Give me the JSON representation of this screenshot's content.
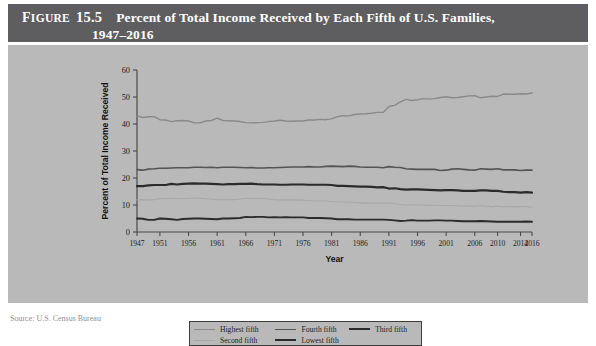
{
  "figure": {
    "label_word": "Figure",
    "label_word_initial": "F",
    "label_word_rest": "IGURE",
    "number": "15.5",
    "title_line1": "Percent of Total Income Received by Each Fifth of U.S. Families,",
    "title_line2": "1947–2016",
    "header_bg": "#5e5e60",
    "panel_bg": "#b9b9b9"
  },
  "legend": {
    "items": [
      {
        "label": "Highest fifth",
        "color": "#8a8a8a",
        "width": 1.4
      },
      {
        "label": "Fourth fifth",
        "color": "#545454",
        "width": 1.6
      },
      {
        "label": "Third fifth",
        "color": "#2b2b2b",
        "width": 2.2
      },
      {
        "label": "Second fifth",
        "color": "#a8a8a8",
        "width": 1.1
      },
      {
        "label": "Lowest fifth",
        "color": "#2b2b2b",
        "width": 1.9
      }
    ]
  },
  "source": {
    "text": "Source: U.S. Census Bureau"
  },
  "chart_data": {
    "type": "line",
    "title": "Percent of Total Income Received by Each Fifth of U.S. Families, 1947–2016",
    "xlabel": "Year",
    "ylabel": "Percent of Total Income Received",
    "xlim": [
      1947,
      2016
    ],
    "ylim": [
      0,
      60
    ],
    "ytick_values": [
      0,
      10,
      20,
      30,
      40,
      50,
      60
    ],
    "ytick_labels": [
      "0",
      "10",
      "20",
      "30",
      "40",
      "50",
      "60"
    ],
    "xtick_values": [
      1947,
      1951,
      1956,
      1961,
      1966,
      1971,
      1976,
      1981,
      1986,
      1991,
      1996,
      2001,
      2006,
      2010,
      2014,
      2016
    ],
    "xtick_labels": [
      "1947",
      "1951",
      "1956",
      "1961",
      "1966",
      "1971",
      "1976",
      "1981",
      "1986",
      "1991",
      "1996",
      "2001",
      "2006",
      "2010",
      "2014",
      "2016"
    ],
    "grid": false,
    "legend_position": "below",
    "x": [
      1947,
      1948,
      1949,
      1950,
      1951,
      1952,
      1953,
      1954,
      1955,
      1956,
      1957,
      1958,
      1959,
      1960,
      1961,
      1962,
      1963,
      1964,
      1965,
      1966,
      1967,
      1968,
      1969,
      1970,
      1971,
      1972,
      1973,
      1974,
      1975,
      1976,
      1977,
      1978,
      1979,
      1980,
      1981,
      1982,
      1983,
      1984,
      1985,
      1986,
      1987,
      1988,
      1989,
      1990,
      1991,
      1992,
      1993,
      1994,
      1995,
      1996,
      1997,
      1998,
      1999,
      2000,
      2001,
      2002,
      2003,
      2004,
      2005,
      2006,
      2007,
      2008,
      2009,
      2010,
      2011,
      2012,
      2013,
      2014,
      2015,
      2016
    ],
    "series": [
      {
        "name": "Highest fifth",
        "color": "#8a8a8a",
        "width": 1.4,
        "values": [
          43.0,
          42.4,
          42.7,
          42.7,
          41.6,
          41.5,
          40.9,
          41.2,
          41.3,
          41.1,
          40.4,
          40.4,
          41.1,
          41.3,
          42.2,
          41.3,
          41.2,
          41.1,
          40.9,
          40.5,
          40.4,
          40.5,
          40.6,
          40.9,
          41.1,
          41.4,
          41.1,
          41.0,
          41.1,
          41.1,
          41.5,
          41.5,
          41.7,
          41.6,
          41.9,
          42.7,
          43.1,
          43.0,
          43.5,
          43.7,
          43.8,
          44.0,
          44.3,
          44.3,
          46.5,
          46.9,
          48.2,
          49.1,
          48.7,
          49.0,
          49.4,
          49.2,
          49.4,
          49.8,
          50.1,
          49.7,
          49.8,
          50.1,
          50.4,
          50.5,
          49.7,
          50.0,
          50.3,
          50.2,
          51.1,
          51.0,
          51.0,
          51.2,
          51.1,
          51.5
        ]
      },
      {
        "name": "Fourth fifth",
        "color": "#545454",
        "width": 1.6,
        "values": [
          23.1,
          22.9,
          23.3,
          23.4,
          23.6,
          23.6,
          23.7,
          23.8,
          23.8,
          23.8,
          24.0,
          24.0,
          23.9,
          24.0,
          23.8,
          24.0,
          24.0,
          24.0,
          23.9,
          23.8,
          23.9,
          23.7,
          23.7,
          23.8,
          23.8,
          23.9,
          24.0,
          24.1,
          24.1,
          24.1,
          24.2,
          24.1,
          24.1,
          24.3,
          24.4,
          24.3,
          24.2,
          24.4,
          24.3,
          24.1,
          24.0,
          24.0,
          24.0,
          23.8,
          24.2,
          24.0,
          23.9,
          23.4,
          23.3,
          23.2,
          23.2,
          23.2,
          23.2,
          22.8,
          22.9,
          23.3,
          23.4,
          23.2,
          23.0,
          22.9,
          23.4,
          23.3,
          23.2,
          23.4,
          23.0,
          23.0,
          23.0,
          22.8,
          22.9,
          22.9
        ]
      },
      {
        "name": "Third fifth",
        "color": "#2b2b2b",
        "width": 2.2,
        "values": [
          17.0,
          17.0,
          17.3,
          17.4,
          17.4,
          17.4,
          17.8,
          17.6,
          17.8,
          17.9,
          18.0,
          17.9,
          17.9,
          17.8,
          17.7,
          17.6,
          17.7,
          17.7,
          17.8,
          17.8,
          17.9,
          17.7,
          17.6,
          17.6,
          17.6,
          17.5,
          17.5,
          17.6,
          17.6,
          17.6,
          17.5,
          17.5,
          17.5,
          17.5,
          17.4,
          17.1,
          17.1,
          17.0,
          16.9,
          16.8,
          16.8,
          16.7,
          16.5,
          16.6,
          16.1,
          16.2,
          15.9,
          15.7,
          15.8,
          15.8,
          15.7,
          15.6,
          15.5,
          15.4,
          15.5,
          15.5,
          15.4,
          15.2,
          15.2,
          15.2,
          15.4,
          15.4,
          15.2,
          15.2,
          14.9,
          14.8,
          14.8,
          14.6,
          14.8,
          14.6
        ]
      },
      {
        "name": "Second fifth",
        "color": "#a8a8a8",
        "width": 1.1,
        "values": [
          11.9,
          12.0,
          11.9,
          12.0,
          12.4,
          12.3,
          12.5,
          12.4,
          12.3,
          12.5,
          12.6,
          12.5,
          12.3,
          12.2,
          12.0,
          12.0,
          12.1,
          12.0,
          12.2,
          12.4,
          12.4,
          12.4,
          12.4,
          12.2,
          12.0,
          11.9,
          11.9,
          12.0,
          11.8,
          11.8,
          11.6,
          11.6,
          11.6,
          11.5,
          11.3,
          11.2,
          11.1,
          11.0,
          10.9,
          10.8,
          10.7,
          10.7,
          10.6,
          10.8,
          10.7,
          10.5,
          10.2,
          10.0,
          10.1,
          10.0,
          10.0,
          9.9,
          9.9,
          9.8,
          9.7,
          9.8,
          9.7,
          9.6,
          9.6,
          9.5,
          9.8,
          9.6,
          9.4,
          9.6,
          9.3,
          9.4,
          9.3,
          9.4,
          9.4,
          9.2
        ]
      },
      {
        "name": "Lowest fifth",
        "color": "#2b2b2b",
        "width": 1.9,
        "values": [
          5.0,
          4.9,
          4.5,
          4.5,
          5.0,
          4.9,
          4.7,
          4.5,
          4.8,
          4.9,
          5.0,
          5.0,
          4.9,
          4.8,
          4.7,
          5.0,
          5.0,
          5.1,
          5.2,
          5.6,
          5.5,
          5.6,
          5.6,
          5.4,
          5.5,
          5.4,
          5.5,
          5.4,
          5.4,
          5.4,
          5.2,
          5.2,
          5.2,
          5.1,
          5.0,
          4.7,
          4.7,
          4.7,
          4.6,
          4.6,
          4.6,
          4.6,
          4.6,
          4.6,
          4.5,
          4.3,
          4.1,
          4.2,
          4.4,
          4.2,
          4.2,
          4.2,
          4.3,
          4.3,
          4.2,
          4.2,
          4.1,
          4.0,
          4.0,
          4.0,
          4.1,
          4.0,
          3.9,
          3.8,
          3.8,
          3.8,
          3.8,
          3.8,
          3.9,
          3.8
        ]
      }
    ]
  }
}
